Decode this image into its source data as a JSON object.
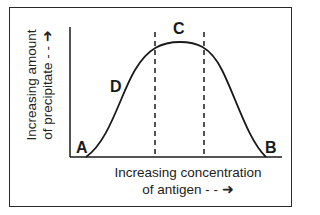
{
  "diagram": {
    "y_axis_label": [
      "Increasing amount",
      "of precipitate - - ➜"
    ],
    "x_axis_label": [
      "Increasing concentration",
      "of antigen - - ➜"
    ],
    "points": {
      "A": "A",
      "B": "B",
      "C": "C",
      "D": "D"
    },
    "colors": {
      "line": "#1a1a1a",
      "background": "#ffffff"
    }
  }
}
